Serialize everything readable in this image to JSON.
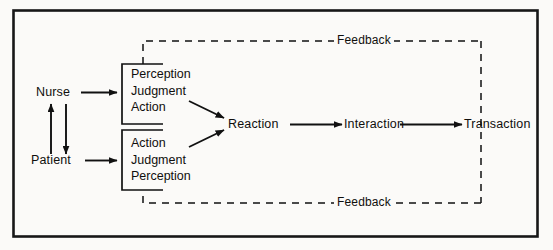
{
  "figure": {
    "frame_color": "#171717",
    "line_color": "#111111",
    "background": "#fbfaf8"
  },
  "actors": {
    "nurse": "Nurse",
    "patient": "Patient"
  },
  "nurse_process": {
    "step1": "Perception",
    "step2": "Judgment",
    "step3": "Action"
  },
  "patient_process": {
    "step1": "Action",
    "step2": "Judgment",
    "step3": "Perception"
  },
  "outcomes": {
    "reaction": "Reaction",
    "interaction": "Interaction",
    "transaction": "Transaction"
  },
  "feedback": {
    "top": "Feedback",
    "bottom": "Feedback"
  },
  "edges": {
    "nurse_to_process": "Nurse to nurse process",
    "patient_to_process": "Patient to patient process",
    "nurse_up": "Patient to Nurse",
    "patient_down": "Nurse to Patient",
    "nurse_process_to_reaction": "Nurse process to Reaction",
    "patient_process_to_reaction": "Patient process to Reaction",
    "reaction_to_interaction": "Reaction to Interaction",
    "interaction_to_transaction": "Interaction to Transaction"
  }
}
